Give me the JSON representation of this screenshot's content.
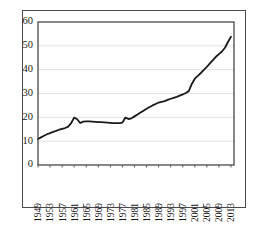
{
  "chart_data": {
    "type": "line",
    "title": "",
    "subtitle": "",
    "xlabel": "",
    "ylabel": "",
    "xlim": [
      1949,
      2014
    ],
    "ylim": [
      0,
      60
    ],
    "grid": true,
    "grid_axis": "y",
    "legend": false,
    "legend_position": "none",
    "line_color": "#1a1a1a",
    "gridline_color": "#d9d9d9",
    "axis_color": "#3a3a3a",
    "background_color": "#ffffff",
    "ytick_labels": [
      "0",
      "10",
      "20",
      "30",
      "40",
      "50",
      "60"
    ],
    "ytick_values": [
      0,
      10,
      20,
      30,
      40,
      50,
      60
    ],
    "xtick_labels": [
      "1949",
      "1953",
      "1957",
      "1961",
      "1965",
      "1969",
      "1973",
      "1977",
      "1981",
      "1985",
      "1989",
      "1993",
      "1997",
      "2001",
      "2005",
      "2009",
      "2013"
    ],
    "xtick_values": [
      1949,
      1953,
      1957,
      1961,
      1965,
      1969,
      1973,
      1977,
      1981,
      1985,
      1989,
      1993,
      1997,
      2001,
      2005,
      2009,
      2013
    ],
    "xtick_rotation": -90,
    "series": [
      {
        "name": "series-1",
        "x": [
          1949,
          1950,
          1951,
          1952,
          1953,
          1954,
          1955,
          1956,
          1957,
          1958,
          1959,
          1960,
          1961,
          1962,
          1963,
          1964,
          1965,
          1966,
          1967,
          1968,
          1969,
          1970,
          1971,
          1972,
          1973,
          1974,
          1975,
          1976,
          1977,
          1978,
          1979,
          1980,
          1981,
          1982,
          1983,
          1984,
          1985,
          1986,
          1987,
          1988,
          1989,
          1990,
          1991,
          1992,
          1993,
          1994,
          1995,
          1996,
          1997,
          1998,
          1999,
          2000,
          2001,
          2002,
          2003,
          2004,
          2005,
          2006,
          2007,
          2008,
          2009,
          2010,
          2011,
          2012,
          2013
        ],
        "values": [
          10.9,
          11.6,
          12.3,
          12.9,
          13.4,
          13.9,
          14.3,
          14.8,
          15.2,
          15.5,
          16.1,
          17.6,
          19.9,
          19.2,
          17.6,
          18.2,
          18.3,
          18.3,
          18.2,
          18.1,
          18.0,
          18.0,
          17.9,
          17.8,
          17.7,
          17.6,
          17.6,
          17.6,
          17.8,
          19.9,
          19.3,
          19.6,
          20.4,
          21.2,
          22.0,
          22.8,
          23.6,
          24.3,
          25.0,
          25.6,
          26.2,
          26.5,
          26.8,
          27.3,
          27.8,
          28.2,
          28.6,
          29.1,
          29.6,
          30.2,
          31.0,
          34.0,
          36.2,
          37.4,
          38.6,
          39.9,
          41.2,
          42.6,
          44.0,
          45.4,
          46.5,
          47.6,
          49.2,
          51.6,
          53.8
        ]
      }
    ]
  }
}
